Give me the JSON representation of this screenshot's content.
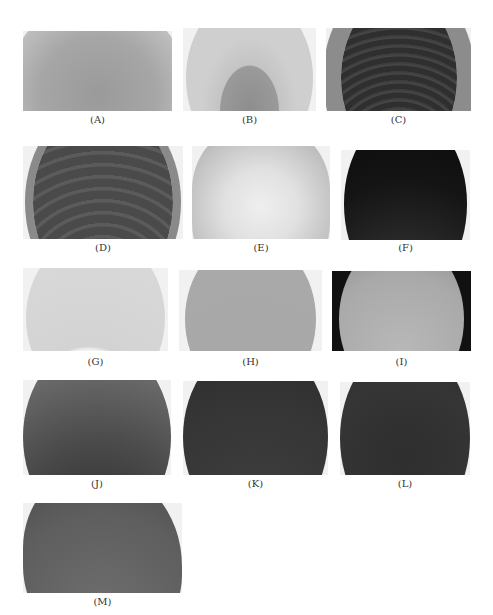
{
  "figure": {
    "panels": [
      {
        "id": "A",
        "label": "(A)",
        "x": 23,
        "y": 31,
        "w": 149,
        "h": 80,
        "tone": "light-gray"
      },
      {
        "id": "B",
        "label": "(B)",
        "x": 183,
        "y": 28,
        "w": 133,
        "h": 83,
        "tone": "light-gray"
      },
      {
        "id": "C",
        "label": "(C)",
        "x": 326,
        "y": 28,
        "w": 145,
        "h": 83,
        "tone": "dark-rings"
      },
      {
        "id": "D",
        "label": "(D)",
        "x": 23,
        "y": 146,
        "w": 160,
        "h": 93,
        "tone": "dark-rings"
      },
      {
        "id": "E",
        "label": "(E)",
        "x": 192,
        "y": 146,
        "w": 138,
        "h": 93,
        "tone": "pale-radial"
      },
      {
        "id": "F",
        "label": "(F)",
        "x": 341,
        "y": 150,
        "w": 129,
        "h": 90,
        "tone": "black-radial"
      },
      {
        "id": "G",
        "label": "(G)",
        "x": 23,
        "y": 268,
        "w": 145,
        "h": 83,
        "tone": "pale-wrinkled"
      },
      {
        "id": "H",
        "label": "(H)",
        "x": 179,
        "y": 270,
        "w": 143,
        "h": 81,
        "tone": "mid-gray"
      },
      {
        "id": "I",
        "label": "(I)",
        "x": 332,
        "y": 271,
        "w": 139,
        "h": 80,
        "tone": "gray-on-black"
      },
      {
        "id": "J",
        "label": "(J)",
        "x": 23,
        "y": 380,
        "w": 148,
        "h": 95,
        "tone": "dark-mottled"
      },
      {
        "id": "K",
        "label": "(K)",
        "x": 183,
        "y": 381,
        "w": 145,
        "h": 94,
        "tone": "dark"
      },
      {
        "id": "L",
        "label": "(L)",
        "x": 340,
        "y": 382,
        "w": 130,
        "h": 93,
        "tone": "dark-wrinkled"
      },
      {
        "id": "M",
        "label": "(M)",
        "x": 23,
        "y": 503,
        "w": 159,
        "h": 90,
        "tone": "mid-dark"
      }
    ],
    "label_rows_y": {
      "A": 120,
      "B": 120,
      "C": 120,
      "D": 248,
      "E": 248,
      "F": 248,
      "G": 362,
      "H": 362,
      "I": 362,
      "J": 484,
      "K": 484,
      "L": 484,
      "M": 602
    }
  }
}
